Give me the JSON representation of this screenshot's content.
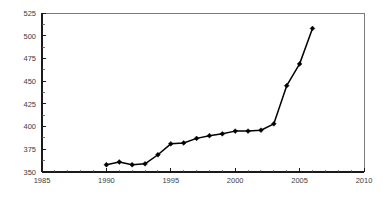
{
  "chart_data": {
    "type": "line",
    "title": "",
    "subtitle": "",
    "xlabel": "",
    "ylabel": "",
    "xlim": [
      1985,
      2010
    ],
    "ylim": [
      350,
      525
    ],
    "grid": false,
    "legend": null,
    "x_ticks": [
      1985,
      1990,
      1995,
      2000,
      2005,
      2010
    ],
    "x_tick_labels": [
      "1985",
      "1990",
      "1995",
      "2000",
      "2005",
      "2010"
    ],
    "x_minor_tick_step": 1,
    "y_ticks": [
      350,
      375,
      400,
      425,
      450,
      475,
      500,
      525
    ],
    "y_tick_labels": [
      "350",
      "375",
      "400",
      "425",
      "450",
      "475",
      "500",
      "525"
    ],
    "marker": "diamond",
    "series": [
      {
        "name": "series-1",
        "color": "#000000",
        "x": [
          1990,
          1991,
          1992,
          1993,
          1994,
          1995,
          1996,
          1997,
          1998,
          1999,
          2000,
          2001,
          2002,
          2003,
          2004,
          2005,
          2006
        ],
        "values": [
          358,
          361,
          358,
          359,
          369,
          381,
          382,
          387,
          390,
          392,
          395,
          395,
          396,
          403,
          445,
          469,
          508
        ]
      }
    ]
  },
  "axes": {
    "y_axis_name": "y-axis",
    "x_axis_name": "x-axis"
  }
}
